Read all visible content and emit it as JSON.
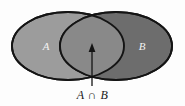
{
  "figure": {
    "kind": "venn-diagram",
    "background_color": "#fdfdfd",
    "caption": "A ∩ B",
    "caption_symbol": "∩",
    "stroke_color": "#141414",
    "annotation": "arrow-pointing-to-intersection"
  },
  "sets": {
    "left": {
      "label": "A",
      "fill_color": "#9c9c9c",
      "label_color": "#f2f2f2",
      "cx": 68,
      "cy": 46,
      "rx": 56,
      "ry": 34,
      "label_x": 46,
      "label_y": 49
    },
    "right": {
      "label": "B",
      "fill_color": "#6d6d6d",
      "label_color": "#f2f2f2",
      "cx": 116,
      "cy": 46,
      "rx": 56,
      "ry": 34,
      "label_x": 142,
      "label_y": 49
    },
    "intersection": {
      "label": "A ∩ B",
      "fill_color": "#898989",
      "region_name": "lens"
    }
  },
  "arrow": {
    "name": "intersection-pointer",
    "color": "#141414",
    "x": 92,
    "tail_y": 86,
    "tip_y": 44,
    "head_width": 7,
    "head_length": 9
  }
}
